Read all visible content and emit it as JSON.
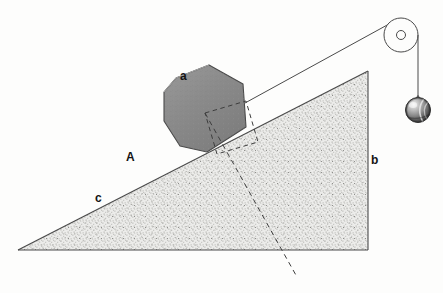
{
  "figure": {
    "type": "physics-mechanics-diagram",
    "canvas": {
      "width": 443,
      "height": 293,
      "background": "#fdfdfc"
    }
  },
  "labels": {
    "plane": {
      "text": "A",
      "x": 126,
      "y": 151,
      "meaning": "inclined-plane-surface"
    },
    "block": {
      "text": "a",
      "x": 180,
      "y": 70,
      "meaning": "block-on-incline"
    },
    "vertical": {
      "text": "b",
      "x": 371,
      "y": 154,
      "meaning": "vertical-height-of-incline"
    },
    "base": {
      "text": "c",
      "x": 95,
      "y": 192,
      "meaning": "hypotenuse-incline-surface"
    }
  },
  "colors": {
    "ink": "#2a2a2a",
    "outline": "#3a3a3a",
    "block_fill": "#8b8b8b",
    "block_edge": "#4a4a4a",
    "plane_fill": "#e6e6e4",
    "plane_stipple": "#9a9a98",
    "ball_dark": "#3c3c3c",
    "ball_light": "#e8e8e8",
    "background": "#fdfdfc"
  },
  "geometry": {
    "incline_triangle": {
      "apex_left": [
        18,
        250
      ],
      "apex_top_right": [
        368,
        71
      ],
      "corner_bottom_right": [
        368,
        250
      ],
      "note": "right triangle; hypotenuse c rises left-to-right, vertical side b on right, base along bottom"
    },
    "block": {
      "polygon": [
        [
          176,
          78
        ],
        [
          209,
          65
        ],
        [
          243,
          84
        ],
        [
          246,
          127
        ],
        [
          207,
          152
        ],
        [
          180,
          146
        ],
        [
          164,
          121
        ],
        [
          164,
          92
        ]
      ],
      "resting_on": "hypotenuse"
    },
    "dashed_square": {
      "corners": [
        [
          205,
          113
        ],
        [
          246,
          101
        ],
        [
          258,
          142
        ],
        [
          217,
          154
        ]
      ],
      "note": "construction square aligned with incline surface"
    },
    "dashed_normal_line": {
      "from": [
        205,
        113
      ],
      "to": [
        297,
        277
      ],
      "note": "dashed line through incline continuing below base"
    },
    "cord": {
      "from_block": [
        245,
        103
      ],
      "to_pulley_tangent": [
        389,
        24
      ]
    },
    "pulley": {
      "center": [
        401,
        35
      ],
      "radius": 17,
      "axle_radius": 4.5
    },
    "hanging_cord": {
      "from": [
        418,
        36
      ],
      "to": [
        418,
        96
      ]
    },
    "weight_ball": {
      "center": [
        418,
        110
      ],
      "radius": 12.5,
      "hook_top": [
        418,
        95
      ]
    }
  },
  "icons": {
    "pulley": "pulley-wheel-icon",
    "weight": "sphere-weight-icon",
    "cord": "cord-line-icon"
  }
}
